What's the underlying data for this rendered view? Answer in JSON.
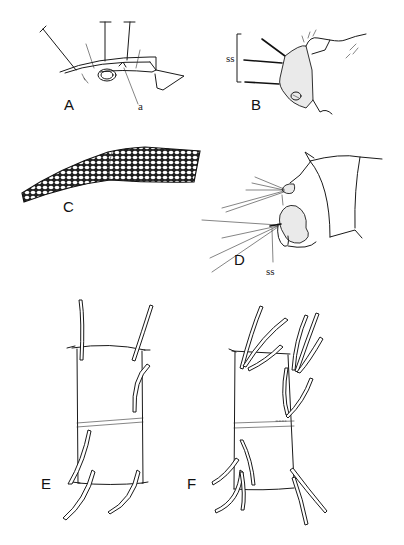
{
  "figure": {
    "panels": [
      {
        "id": "A",
        "label": "A",
        "annotations": [
          "a"
        ]
      },
      {
        "id": "B",
        "label": "B",
        "annotations": [
          "ss"
        ]
      },
      {
        "id": "C",
        "label": "C",
        "annotations": []
      },
      {
        "id": "D",
        "label": "D",
        "annotations": [
          "ss"
        ]
      },
      {
        "id": "E",
        "label": "E",
        "annotations": []
      },
      {
        "id": "F",
        "label": "F",
        "annotations": []
      }
    ]
  }
}
